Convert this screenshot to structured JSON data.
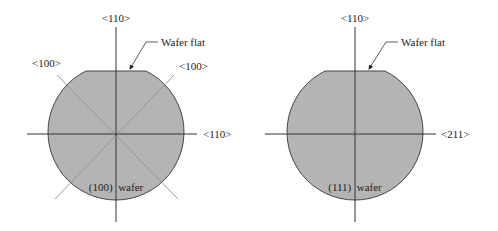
{
  "figure": {
    "colors": {
      "wafer_fill": "#b4b4b4",
      "wafer_stroke": "#444444",
      "axis_line": "#333333",
      "diag_line": "#9a9a9a",
      "text": "#222222"
    },
    "wafers": [
      {
        "id": "wafer-100",
        "caption": "(100)  wafer",
        "labels": {
          "top": "<110>",
          "right": "<110>",
          "upper_left": "<100>",
          "upper_right": "<100>",
          "flat": "Wafer flat"
        }
      },
      {
        "id": "wafer-111",
        "caption": "(111)  wafer",
        "labels": {
          "top": "<110>",
          "right": "<211>",
          "flat": "Wafer flat"
        }
      }
    ]
  }
}
